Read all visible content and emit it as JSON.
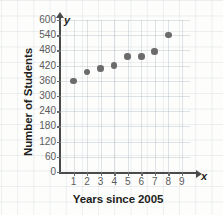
{
  "chart_data": {
    "type": "scatter",
    "title": "",
    "xlabel": "Years since 2005",
    "ylabel": "Number of Students",
    "x_axis_letter": "x",
    "y_axis_letter": "y",
    "xlim": [
      0,
      9.6
    ],
    "ylim": [
      0,
      600
    ],
    "grid": true,
    "legend": "none",
    "xticks": [
      1,
      2,
      3,
      4,
      5,
      6,
      7,
      8,
      9
    ],
    "yticks": [
      0,
      60,
      120,
      180,
      240,
      300,
      360,
      420,
      480,
      540,
      600
    ],
    "xtick_labels": [
      "1",
      "2",
      "3",
      "4",
      "5",
      "6",
      "7",
      "8",
      "9"
    ],
    "ytick_labels": [
      "0",
      "60",
      "120",
      "180",
      "240",
      "300",
      "360",
      "420",
      "480",
      "540",
      "600"
    ],
    "point_color": "#6b6b6b",
    "axis_color": "#4a4a4a",
    "grid_color": "#96a5b4",
    "x": [
      1,
      2,
      3,
      4,
      5,
      6,
      7,
      8
    ],
    "y": [
      360,
      395,
      408,
      420,
      455,
      455,
      475,
      540
    ],
    "points": [
      {
        "x": 1,
        "y": 360
      },
      {
        "x": 2,
        "y": 395
      },
      {
        "x": 3,
        "y": 408
      },
      {
        "x": 4,
        "y": 420
      },
      {
        "x": 5,
        "y": 455
      },
      {
        "x": 6,
        "y": 455
      },
      {
        "x": 7,
        "y": 475
      },
      {
        "x": 8,
        "y": 540
      }
    ]
  }
}
